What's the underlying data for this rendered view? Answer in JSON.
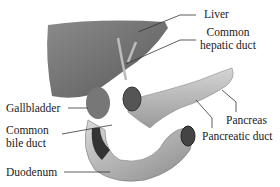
{
  "diagram": {
    "labels": {
      "liver": "Liver",
      "common_hepatic_duct_line1": "Common",
      "common_hepatic_duct_line2": "hepatic duct",
      "gallbladder": "Gallbladder",
      "common_bile_duct_line1": "Common",
      "common_bile_duct_line2": "bile duct",
      "pancreas": "Pancreas",
      "pancreatic_duct": "Pancreatic duct",
      "duodenum": "Duodenum"
    },
    "colors": {
      "tissue_dark": "#6e6e6e",
      "tissue_mid": "#9a9a9a",
      "tissue_light": "#cfcfcf",
      "leader_line": "#333333"
    }
  }
}
